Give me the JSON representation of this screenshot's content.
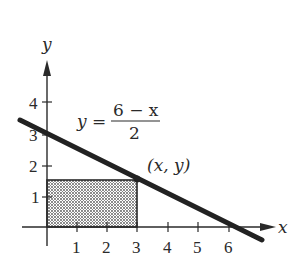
{
  "diagram": {
    "axes": {
      "x_label": "x",
      "y_label": "y",
      "x_ticks": [
        "1",
        "2",
        "3",
        "4",
        "5",
        "6"
      ],
      "y_ticks": [
        "1",
        "2",
        "3",
        "4"
      ]
    },
    "line": {
      "equation_lhs": "y =",
      "numerator": "6 − x",
      "denominator": "2",
      "y_intercept": 3,
      "x_intercept": 6
    },
    "point": {
      "label": "(x, y)",
      "x": 3,
      "y": 1.5
    },
    "rectangle": {
      "fill": "dotted",
      "from": [
        0,
        0
      ],
      "to": [
        3,
        1.5
      ]
    },
    "colors": {
      "ink": "#2a2a2a",
      "line": "#222222",
      "shade": "#9a9a9a"
    }
  }
}
